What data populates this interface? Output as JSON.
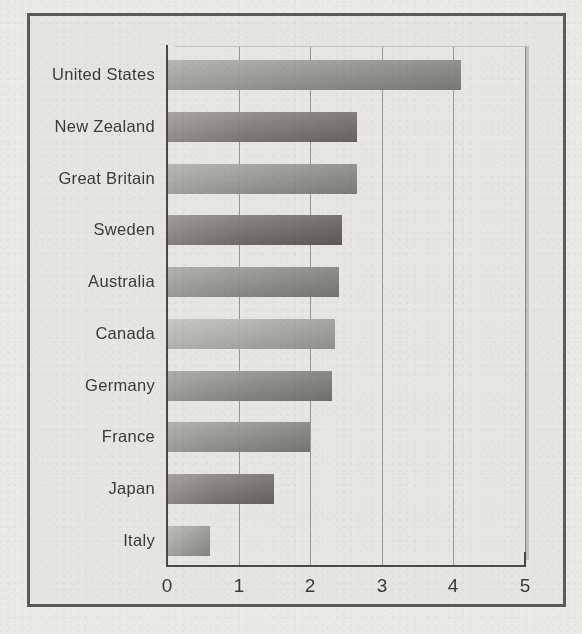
{
  "chart_data": {
    "type": "bar",
    "orientation": "horizontal",
    "title": "",
    "subtitle": "",
    "xlabel": "",
    "ylabel": "",
    "xlim": [
      0,
      5
    ],
    "xticks": [
      "0",
      "1",
      "2",
      "3",
      "4",
      "5"
    ],
    "grid": true,
    "legend": null,
    "categories": [
      "United States",
      "New Zealand",
      "Great Britain",
      "Sweden",
      "Australia",
      "Canada",
      "Germany",
      "France",
      "Japan",
      "Italy"
    ],
    "values": [
      4.1,
      2.65,
      2.65,
      2.45,
      2.4,
      2.35,
      2.3,
      2.0,
      1.5,
      0.6
    ],
    "bar_colors": [
      "#8f8d89",
      "#77746f",
      "#93918c",
      "#6a6762",
      "#8a8883",
      "#aaa8a3",
      "#85837e",
      "#8b8984",
      "#75726d",
      "#9c9a95"
    ]
  },
  "style": {
    "page_background": "#eceae6",
    "frame_border": "#5c5b58",
    "axis_color": "#494845",
    "gridline_color": "#5a5855",
    "text_color": "#3b3a38"
  }
}
